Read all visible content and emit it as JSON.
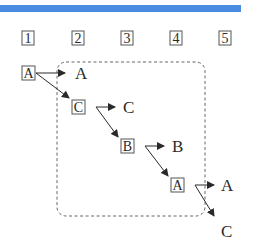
{
  "header_bar": {
    "color": "#4a8ae0"
  },
  "steps": [
    {
      "label": "1",
      "x": 22
    },
    {
      "label": "2",
      "x": 72
    },
    {
      "label": "3",
      "x": 121
    },
    {
      "label": "4",
      "x": 170
    },
    {
      "label": "5",
      "x": 219
    }
  ],
  "nodes": [
    {
      "id": "n1",
      "label": "A",
      "x": 22,
      "y": 66
    },
    {
      "id": "n2",
      "label": "C",
      "x": 72,
      "y": 100
    },
    {
      "id": "n3",
      "label": "B",
      "x": 121,
      "y": 139
    },
    {
      "id": "n4",
      "label": "A",
      "x": 171,
      "y": 178
    }
  ],
  "outputs": [
    {
      "id": "o1",
      "label": "A",
      "x": 76,
      "y": 79
    },
    {
      "id": "o2",
      "label": "C",
      "x": 124,
      "y": 118
    },
    {
      "id": "o3",
      "label": "B",
      "x": 173,
      "y": 157
    },
    {
      "id": "o4",
      "label": "A",
      "x": 222,
      "y": 196
    },
    {
      "id": "o5",
      "label": "C",
      "x": 222,
      "y": 238
    }
  ],
  "colors": {
    "ink": "#2a2a2a",
    "box": "#555555",
    "dash": "#666666"
  }
}
